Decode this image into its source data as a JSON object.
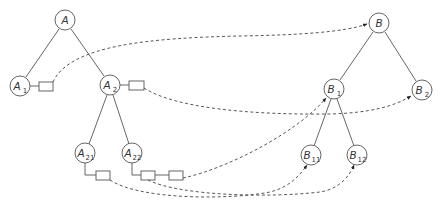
{
  "diagram": {
    "colors": {
      "stroke": "#555555",
      "pointer": "#444444",
      "background": "#ffffff"
    },
    "tree_a": {
      "nodes": [
        {
          "id": "A",
          "label": "A",
          "sub": "",
          "x": 65,
          "y": 20
        },
        {
          "id": "A1",
          "label": "A",
          "sub": "1",
          "x": 20,
          "y": 86
        },
        {
          "id": "A2",
          "label": "A",
          "sub": "2",
          "x": 110,
          "y": 85
        },
        {
          "id": "A21",
          "label": "A",
          "sub": "21",
          "x": 85,
          "y": 153
        },
        {
          "id": "A22",
          "label": "A",
          "sub": "22",
          "x": 132,
          "y": 153
        }
      ],
      "edges": [
        [
          "A",
          "A1"
        ],
        [
          "A",
          "A2"
        ],
        [
          "A2",
          "A21"
        ],
        [
          "A2",
          "A22"
        ]
      ]
    },
    "tree_b": {
      "nodes": [
        {
          "id": "B",
          "label": "B",
          "sub": "",
          "x": 379,
          "y": 23
        },
        {
          "id": "B1",
          "label": "B",
          "sub": "1",
          "x": 334,
          "y": 89
        },
        {
          "id": "B2",
          "label": "B",
          "sub": "2",
          "x": 422,
          "y": 90
        },
        {
          "id": "B11",
          "label": "B",
          "sub": "11",
          "x": 311,
          "y": 155
        },
        {
          "id": "B12",
          "label": "B",
          "sub": "12",
          "x": 357,
          "y": 155
        }
      ],
      "edges": [
        [
          "B",
          "B1"
        ],
        [
          "B",
          "B2"
        ],
        [
          "B1",
          "B11"
        ],
        [
          "B1",
          "B12"
        ]
      ]
    },
    "pointer_boxes": [
      {
        "owner": "A1",
        "target": "B"
      },
      {
        "owner": "A2",
        "target": "B2"
      },
      {
        "owner": "A21",
        "target": "B11"
      },
      {
        "owner": "A22",
        "target": "B12"
      },
      {
        "owner": "A22",
        "target": "B1"
      }
    ]
  }
}
